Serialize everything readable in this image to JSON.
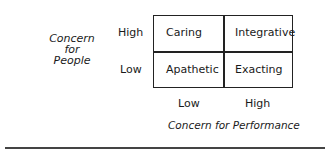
{
  "diagram": {
    "y_axis": {
      "label_lines": [
        "Concern",
        "for",
        "People"
      ],
      "ticks": {
        "high": "High",
        "low": "Low"
      }
    },
    "x_axis": {
      "label": "Concern for Performance",
      "ticks": {
        "low": "Low",
        "high": "High"
      }
    },
    "cells": {
      "high_low": "Caring",
      "high_high": "Integrative",
      "low_low": "Apathetic",
      "low_high": "Exacting"
    }
  }
}
